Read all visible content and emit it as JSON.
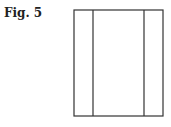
{
  "figure": {
    "caption": "Fig. 5",
    "stroke_color": "#333333",
    "rect": {
      "x": 74,
      "y": 10,
      "w": 89,
      "h": 106
    },
    "divider_x": [
      93,
      144
    ]
  }
}
